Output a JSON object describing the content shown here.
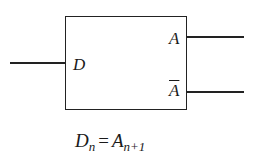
{
  "diagram": {
    "type": "flip-flop-block",
    "input": {
      "label": "D"
    },
    "outputs": [
      {
        "label": "A"
      },
      {
        "label": "A",
        "overline": true
      }
    ],
    "equation": {
      "lhs": "D",
      "lhs_sub": "n",
      "op": "=",
      "rhs": "A",
      "rhs_sub": "n+1"
    }
  }
}
